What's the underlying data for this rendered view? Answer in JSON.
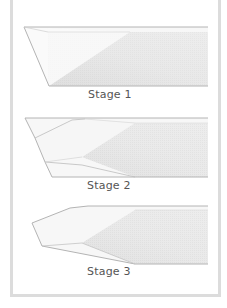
{
  "figure": {
    "stages": [
      {
        "label": "Stage 1"
      },
      {
        "label": "Stage 2"
      },
      {
        "label": "Stage 3"
      }
    ],
    "colors": {
      "outline": "#b4b4b4",
      "hatch_fill": "#e6e6e6",
      "light_fill": "#f6f6f6",
      "frame": "#dcdcdc",
      "label_text": "#555555"
    }
  }
}
